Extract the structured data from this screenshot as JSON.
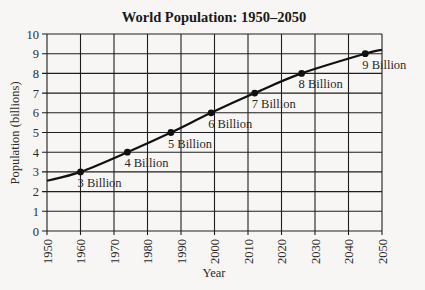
{
  "chart_data": {
    "type": "line",
    "title": "World Population: 1950–2050",
    "xlabel": "Year",
    "ylabel": "Population (billions)",
    "xlim": [
      1950,
      2050
    ],
    "ylim": [
      0,
      10
    ],
    "x_ticks": [
      1950,
      1960,
      1970,
      1980,
      1990,
      2000,
      2010,
      2020,
      2030,
      2040,
      2050
    ],
    "y_ticks": [
      0,
      1,
      2,
      3,
      4,
      5,
      6,
      7,
      8,
      9,
      10
    ],
    "grid": true,
    "legend": null,
    "series": [
      {
        "name": "World Population",
        "x": [
          1950,
          1960,
          1974,
          1987,
          1999,
          2012,
          2026,
          2045,
          2050
        ],
        "y": [
          2.55,
          3.0,
          4.0,
          5.0,
          6.0,
          7.0,
          8.0,
          9.0,
          9.2
        ]
      }
    ],
    "annotations": [
      {
        "x": 1960,
        "y": 3,
        "label": "3 Billion"
      },
      {
        "x": 1974,
        "y": 4,
        "label": "4 Billion"
      },
      {
        "x": 1987,
        "y": 5,
        "label": "5 Billion"
      },
      {
        "x": 1999,
        "y": 6,
        "label": "6 Billion"
      },
      {
        "x": 2012,
        "y": 7,
        "label": "7 Billion"
      },
      {
        "x": 2026,
        "y": 8,
        "label": "8 Billion"
      },
      {
        "x": 2045,
        "y": 9,
        "label": "9 Billion"
      }
    ]
  },
  "colors": {
    "background": "#f7f6f4",
    "grid": "#1e1e1e",
    "line": "#111111",
    "text": "#2a2a2a"
  }
}
